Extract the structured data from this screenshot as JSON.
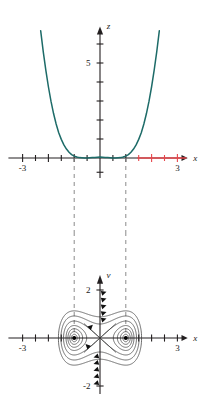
{
  "figure": {
    "title": "",
    "panels": [
      "potential-plot",
      "phase-portrait"
    ]
  },
  "colors": {
    "curve_teal": "#1d6b68",
    "highlight_red": "#e8474c",
    "axis_black": "#231f20",
    "orbit_black": "#3a3a3a",
    "dashed_gray": "#8a8a8a"
  },
  "top_panel": {
    "name": "potential-plot",
    "yaxis_label": "z",
    "xaxis_label": "x",
    "y_tick_labels": [
      "5"
    ],
    "x_tick_labels": [
      "-3",
      "3"
    ],
    "x_left_label": "-3",
    "x_right_label": "3"
  },
  "bottom_panel": {
    "name": "phase-portrait",
    "yaxis_label": "v",
    "xaxis_label": "x",
    "y_tick_labels": [
      "2",
      "-2"
    ],
    "y_top_label": "2",
    "y_bottom_label": "-2",
    "x_left_label": "-3",
    "x_right_label": "3"
  },
  "chart_data": [
    {
      "type": "line",
      "name": "double-well-potential",
      "title": "",
      "xlabel": "x",
      "ylabel": "z",
      "xlim": [
        -3.6,
        3.4
      ],
      "ylim": [
        -1.1,
        7.2
      ],
      "xticks": [
        -3,
        -2.5,
        -2,
        -1.5,
        -1,
        -0.5,
        0.5,
        1,
        1.5,
        2,
        2.5,
        3
      ],
      "yticks": [
        1,
        2,
        3,
        4,
        5,
        6
      ],
      "labeled_xticks": [
        -3,
        3
      ],
      "labeled_yticks": [
        5
      ],
      "grid": false,
      "legend": false,
      "series": [
        {
          "name": "z = (x^2 - 1)^2 / 4 type double well",
          "color": "#1d6b68",
          "x": [
            -2.3,
            -2.2,
            -2.1,
            -2.0,
            -1.9,
            -1.8,
            -1.7,
            -1.6,
            -1.5,
            -1.4,
            -1.3,
            -1.2,
            -1.1,
            -1.0,
            -0.9,
            -0.8,
            -0.7,
            -0.6,
            -0.5,
            -0.4,
            -0.3,
            -0.2,
            -0.1,
            0.0,
            0.1,
            0.2,
            0.3,
            0.4,
            0.5,
            0.6,
            0.7,
            0.8,
            0.9,
            1.0,
            1.1,
            1.2,
            1.3,
            1.4,
            1.5,
            1.6,
            1.7,
            1.8,
            1.9,
            2.0,
            2.1,
            2.2,
            2.3
          ],
          "y": [
            6.7,
            5.6,
            4.62,
            3.75,
            2.99,
            2.34,
            1.79,
            1.33,
            0.98,
            0.69,
            0.47,
            0.3,
            0.18,
            0.1,
            0.05,
            0.02,
            0.01,
            0.0,
            0.0,
            0.01,
            0.02,
            0.03,
            0.04,
            0.05,
            0.04,
            0.03,
            0.02,
            0.01,
            0.0,
            0.0,
            0.01,
            0.02,
            0.05,
            0.1,
            0.18,
            0.3,
            0.47,
            0.69,
            0.98,
            1.33,
            1.79,
            2.34,
            2.99,
            3.75,
            4.62,
            5.6,
            6.7
          ],
          "minima_x": [
            -1.0,
            1.0
          ],
          "local_max_x": 0.0
        }
      ],
      "annotations": [
        {
          "type": "axis-segment",
          "color": "#e8474c",
          "x_from": 1.45,
          "x_to": 3.35,
          "note": "red highlighted portion of x-axis on the right"
        },
        {
          "type": "dashed-vertical",
          "color": "#8a8a8a",
          "x": -1.0
        },
        {
          "type": "dashed-vertical",
          "color": "#8a8a8a",
          "x": 1.0
        }
      ]
    },
    {
      "type": "line",
      "name": "phase-portrait-duffing",
      "title": "",
      "xlabel": "x",
      "ylabel": "v",
      "xlim": [
        -3.6,
        3.4
      ],
      "ylim": [
        -2.85,
        2.85
      ],
      "xticks": [
        -3,
        -2.5,
        -2,
        -1.5,
        1.5,
        2,
        2.5,
        3
      ],
      "yticks": [
        2,
        -2
      ],
      "labeled_xticks": [
        -3,
        3
      ],
      "labeled_yticks": [
        2,
        -2
      ],
      "grid": false,
      "legend": false,
      "equilibria": [
        {
          "type": "center",
          "x": -1.0,
          "v": 0.0
        },
        {
          "type": "saddle",
          "x": 0.0,
          "v": 0.0
        },
        {
          "type": "center",
          "x": 1.0,
          "v": 0.0
        }
      ],
      "orbit_energy_levels": [
        0.012,
        0.035,
        0.075,
        0.135,
        0.25,
        0.42,
        0.64
      ],
      "separatrix_energy": 0.25,
      "flow_direction": "clockwise around right center, counter-clockwise around left center",
      "annotations": [
        {
          "type": "dashed-vertical",
          "color": "#8a8a8a",
          "x": -1.0
        },
        {
          "type": "dashed-vertical",
          "color": "#8a8a8a",
          "x": 1.0
        }
      ]
    }
  ]
}
